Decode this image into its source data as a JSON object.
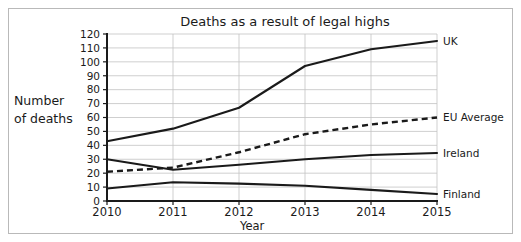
{
  "chart_data": {
    "type": "line",
    "title": "Deaths as a result of legal highs",
    "xlabel": "Year",
    "ylabel": "Number of deaths",
    "ylabel_line1": "Number",
    "ylabel_line2": "of deaths",
    "categories": [
      "2010",
      "2011",
      "2012",
      "2013",
      "2014",
      "2015"
    ],
    "x": [
      2010,
      2011,
      2012,
      2013,
      2014,
      2015
    ],
    "xlim": [
      2010,
      2015
    ],
    "ylim": [
      0,
      120
    ],
    "ytick_labels": [
      "0",
      "10",
      "20",
      "30",
      "40",
      "50",
      "60",
      "70",
      "80",
      "90",
      "100",
      "110",
      "120"
    ],
    "yticks": [
      0,
      10,
      20,
      30,
      40,
      50,
      60,
      70,
      80,
      90,
      100,
      110,
      120
    ],
    "grid": true,
    "legend_position": "right-inline-labels",
    "series": [
      {
        "name": "UK",
        "label": "UK",
        "style": "solid",
        "color": "#1a1a1a",
        "values": [
          43,
          52,
          67,
          97,
          109,
          115
        ]
      },
      {
        "name": "EU Average",
        "label": "EU Average",
        "style": "dashed",
        "color": "#1a1a1a",
        "values": [
          21,
          24,
          35,
          48,
          55,
          60
        ]
      },
      {
        "name": "Ireland",
        "label": "Ireland",
        "style": "solid",
        "color": "#1a1a1a",
        "values": [
          30,
          22.5,
          26,
          30,
          33,
          34.5
        ]
      },
      {
        "name": "Finland",
        "label": "Finland",
        "style": "solid",
        "color": "#1a1a1a",
        "values": [
          9,
          13.5,
          12.5,
          11,
          8,
          5
        ]
      }
    ]
  },
  "frame": {
    "border_color": "#b9b9b9",
    "background": "#ffffff"
  }
}
